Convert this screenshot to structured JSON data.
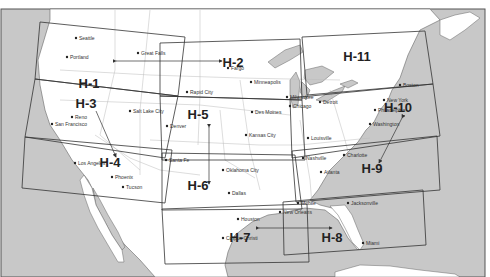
{
  "map": {
    "colors": {
      "water": "#c8c8c8",
      "land": "#ffffff",
      "border": "#555555",
      "state_line": "#bbbbbb",
      "chart_box": "#333333",
      "text": "#222222"
    },
    "chart_areas": [
      {
        "id": "H-1",
        "label": "H-1",
        "x": 89,
        "y": 88
      },
      {
        "id": "H-2",
        "label": "H-2",
        "x": 233,
        "y": 67
      },
      {
        "id": "H-3",
        "label": "H-3",
        "x": 86,
        "y": 108
      },
      {
        "id": "H-4",
        "label": "H-4",
        "x": 110,
        "y": 167
      },
      {
        "id": "H-5",
        "label": "H-5",
        "x": 198,
        "y": 119
      },
      {
        "id": "H-6",
        "label": "H-6",
        "x": 198,
        "y": 190
      },
      {
        "id": "H-7",
        "label": "H-7",
        "x": 240,
        "y": 242
      },
      {
        "id": "H-8",
        "label": "H-8",
        "x": 332,
        "y": 242
      },
      {
        "id": "H-9",
        "label": "H-9",
        "x": 372,
        "y": 173
      },
      {
        "id": "H-10",
        "label": "H-10",
        "x": 398,
        "y": 112
      },
      {
        "id": "H-11",
        "label": "H-11",
        "x": 357,
        "y": 61
      }
    ],
    "cities": [
      {
        "name": "Seattle",
        "x": 76,
        "y": 38
      },
      {
        "name": "Great Falls",
        "x": 138,
        "y": 53
      },
      {
        "name": "Portland",
        "x": 67,
        "y": 57
      },
      {
        "name": "Fargo",
        "x": 228,
        "y": 68
      },
      {
        "name": "Minneapolis",
        "x": 251,
        "y": 82
      },
      {
        "name": "Rapid City",
        "x": 187,
        "y": 92
      },
      {
        "name": "Boston",
        "x": 400,
        "y": 85
      },
      {
        "name": "Salt Lake City",
        "x": 130,
        "y": 111
      },
      {
        "name": "Reno",
        "x": 72,
        "y": 117
      },
      {
        "name": "San Francisco",
        "x": 52,
        "y": 124
      },
      {
        "name": "Denver",
        "x": 167,
        "y": 126
      },
      {
        "name": "Milwaukee",
        "x": 287,
        "y": 97
      },
      {
        "name": "Chicago",
        "x": 290,
        "y": 106
      },
      {
        "name": "Detroit",
        "x": 320,
        "y": 102
      },
      {
        "name": "New York",
        "x": 384,
        "y": 100
      },
      {
        "name": "Philadelphia",
        "x": 375,
        "y": 110
      },
      {
        "name": "Des Moines",
        "x": 252,
        "y": 112
      },
      {
        "name": "Washington",
        "x": 370,
        "y": 124
      },
      {
        "name": "Kansas City",
        "x": 246,
        "y": 135
      },
      {
        "name": "Louisville",
        "x": 308,
        "y": 138
      },
      {
        "name": "Los Angeles",
        "x": 75,
        "y": 163
      },
      {
        "name": "Santa Fe",
        "x": 166,
        "y": 160
      },
      {
        "name": "Phoenix",
        "x": 112,
        "y": 177
      },
      {
        "name": "Tucson",
        "x": 123,
        "y": 187
      },
      {
        "name": "Oklahoma City",
        "x": 223,
        "y": 170
      },
      {
        "name": "Dallas",
        "x": 229,
        "y": 193
      },
      {
        "name": "Nashville",
        "x": 303,
        "y": 158
      },
      {
        "name": "Charlotte",
        "x": 344,
        "y": 155
      },
      {
        "name": "Atlanta",
        "x": 321,
        "y": 172
      },
      {
        "name": "Mobile",
        "x": 298,
        "y": 203
      },
      {
        "name": "Jacksonville",
        "x": 348,
        "y": 203
      },
      {
        "name": "New Orleans",
        "x": 280,
        "y": 212
      },
      {
        "name": "Houston",
        "x": 238,
        "y": 219
      },
      {
        "name": "Corpus Christi",
        "x": 223,
        "y": 238
      },
      {
        "name": "Miami",
        "x": 363,
        "y": 243
      }
    ]
  }
}
